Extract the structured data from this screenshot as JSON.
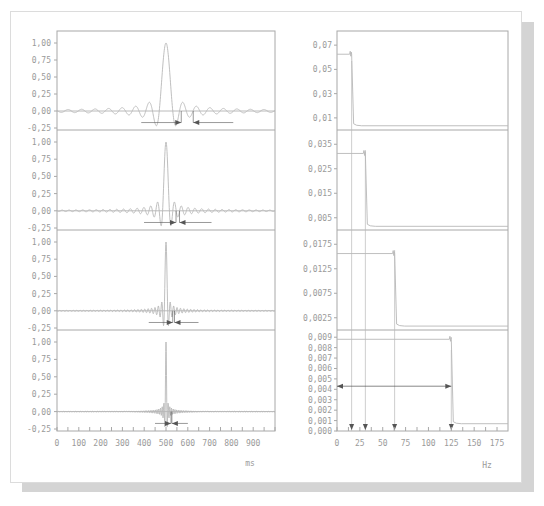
{
  "figure": {
    "left_xlabel": "ms",
    "right_xlabel": "Hz",
    "colors": {
      "trace": "#b8b8b8",
      "axis": "#a8a8a8",
      "text": "#9a9a9a",
      "arrow": "#555555",
      "shadow": "#d4d4d4"
    }
  },
  "chart_data": [
    {
      "type": "line",
      "title": "Time-domain sinc pulses (4 stacked panels)",
      "xlabel": "ms",
      "xlim": [
        0,
        1000
      ],
      "x_ticks": [
        "0",
        "100",
        "200",
        "300",
        "400",
        "500",
        "600",
        "700",
        "800",
        "900"
      ],
      "y_ticks": [
        "1,00",
        "0,75",
        "0,50",
        "0,25",
        "0,00",
        "-0,25"
      ],
      "ylim": [
        -0.3,
        1.1
      ],
      "grid": false,
      "panels": [
        {
          "peak_x": 500,
          "peak_y": 1.0,
          "main_lobe_halfwidth_ms": 31,
          "arrow_markers_ms": [
            570,
            625
          ]
        },
        {
          "peak_x": 500,
          "peak_y": 1.0,
          "main_lobe_halfwidth_ms": 15.6,
          "arrow_markers_ms": [
            546,
            562
          ]
        },
        {
          "peak_x": 500,
          "peak_y": 1.0,
          "main_lobe_halfwidth_ms": 7.8,
          "arrow_markers_ms": [
            531,
            539
          ]
        },
        {
          "peak_x": 500,
          "peak_y": 1.0,
          "main_lobe_halfwidth_ms": 3.9,
          "arrow_markers_ms": [
            523,
            527
          ]
        }
      ]
    },
    {
      "type": "line",
      "title": "Frequency spectra (4 stacked panels)",
      "xlabel": "Hz",
      "xlim": [
        0,
        187
      ],
      "x_ticks": [
        "0",
        "25",
        "50",
        "75",
        "100",
        "125",
        "150",
        "175"
      ],
      "grid": false,
      "panels": [
        {
          "y_ticks": [
            "0,07",
            "0,05",
            "0,03",
            "0,01"
          ],
          "ylim": [
            0,
            0.08
          ],
          "level": 0.0625,
          "cutoff_hz": 16,
          "floor": 0.0035
        },
        {
          "y_ticks": [
            "0,035",
            "0,025",
            "0,015",
            "0,005"
          ],
          "ylim": [
            0,
            0.04
          ],
          "level": 0.03125,
          "cutoff_hz": 31,
          "floor": 0.0015
        },
        {
          "y_ticks": [
            "0,0175",
            "0,0125",
            "0,0075",
            "0,0025"
          ],
          "ylim": [
            0,
            0.02
          ],
          "level": 0.0156,
          "cutoff_hz": 63,
          "floor": 0.0008
        },
        {
          "y_ticks": [
            "0,009",
            "0,008",
            "0,007",
            "0,006",
            "0,005",
            "0,004",
            "0,003",
            "0,002",
            "0,001",
            "0,000"
          ],
          "ylim": [
            0,
            0.0095
          ],
          "level": 0.0088,
          "cutoff_hz": 125,
          "floor": 0.0007
        }
      ],
      "annotations": {
        "cutoff_markers_hz": [
          16,
          31,
          63,
          125
        ],
        "double_arrow": {
          "from_hz": 0,
          "to_hz": 125,
          "y": 0.0043
        }
      }
    }
  ]
}
